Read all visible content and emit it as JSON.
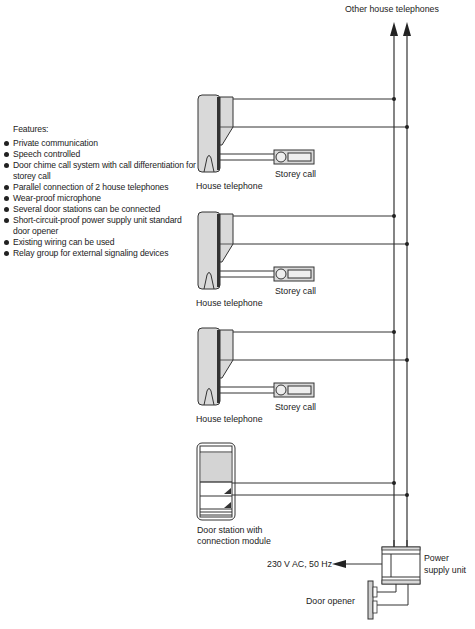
{
  "diagram": {
    "top_label": "Other house telephones",
    "features": {
      "title": "Features:",
      "items": [
        "Private communication",
        "Speech controlled",
        "Door chime call system with call differentiation for storey call",
        "Parallel connection of 2 house telephones",
        "Wear-proof microphone",
        "Several door stations can be connected",
        "Short-circuit-proof power supply unit standard door opener",
        "Existing wiring can be used",
        "Relay group for external signaling devices"
      ]
    },
    "house_telephones": [
      {
        "label": "House telephone",
        "storey_call_label": "Storey call"
      },
      {
        "label": "House telephone",
        "storey_call_label": "Storey call"
      },
      {
        "label": "House telephone",
        "storey_call_label": "Storey call"
      }
    ],
    "door_station": {
      "label_line1": "Door station with",
      "label_line2": "connection module"
    },
    "power_supply": {
      "label_line1": "Power",
      "label_line2": "supply unit",
      "input_label": "230 V AC, 50 Hz"
    },
    "door_opener": {
      "label": "Door opener"
    },
    "colors": {
      "line": "#333333",
      "device_fill": "#d9d9d9",
      "device_stroke": "#333333"
    }
  }
}
